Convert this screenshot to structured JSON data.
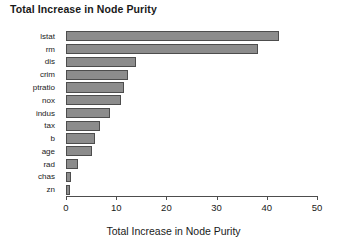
{
  "chart_data": {
    "type": "bar",
    "orientation": "horizontal",
    "title": "Total Increase in Node Purity",
    "xlabel": "Total Increase in Node Purity",
    "ylabel": "",
    "xlim": [
      0,
      50
    ],
    "xticks": [
      0,
      10,
      20,
      30,
      40,
      50
    ],
    "xticklabels": [
      "0",
      "10",
      "20",
      "30",
      "40",
      "50"
    ],
    "grid": false,
    "legend": null,
    "categories": [
      "lstat",
      "rm",
      "dis",
      "crim",
      "ptratio",
      "nox",
      "indus",
      "tax",
      "b",
      "age",
      "rad",
      "chas",
      "zn"
    ],
    "values": [
      42.4,
      38.2,
      14.0,
      12.4,
      11.5,
      11.0,
      8.8,
      6.8,
      5.8,
      5.2,
      2.4,
      1.0,
      0.8
    ],
    "bar_fill_color": "#8c8c8c",
    "bar_border_color": "#4d4d4d",
    "axis_color": "#4d4d4d",
    "background_color": "#ffffff"
  }
}
